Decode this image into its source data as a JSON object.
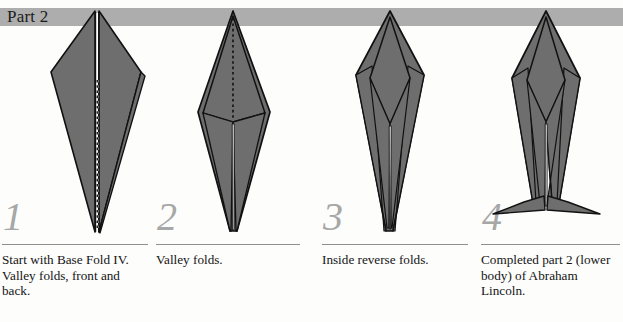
{
  "header": {
    "title": "Part 2",
    "band_color": "#adadad"
  },
  "palette": {
    "paper_fill": "#6e6e6e",
    "paper_fill_light": "#7c7c7c",
    "outline": "#111111",
    "crease_dotted": "#111111",
    "white_gap": "#ffffff",
    "number_color": "#a7a7a7",
    "rule_color": "#8e8e8e",
    "background": "#fdfdfc"
  },
  "steps": [
    {
      "number": "1",
      "caption": "Start with Base Fold IV. Valley folds, front and back.",
      "figure_name": "base-fold-iv-kite"
    },
    {
      "number": "2",
      "caption": "Valley folds.",
      "figure_name": "narrowed-diamond-tail"
    },
    {
      "number": "3",
      "caption": "Inside reverse folds.",
      "figure_name": "inside-reverse-folded-body"
    },
    {
      "number": "4",
      "caption": "Completed part 2 (lower body) of Abraham Lincoln.",
      "figure_name": "completed-lower-body-with-feet"
    }
  ]
}
